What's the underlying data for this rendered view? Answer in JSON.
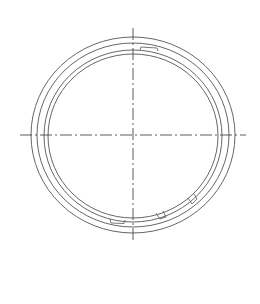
{
  "drawing": {
    "type": "technical-drawing",
    "subject": "retaining ring / seal ring front view",
    "center": {
      "x": 133,
      "y": 135
    },
    "colors": {
      "background": "#ffffff",
      "line": "#555555",
      "centerline": "#333333"
    },
    "rings": [
      {
        "name": "outer-ring-outer-edge",
        "rx": 102,
        "ry": 98
      },
      {
        "name": "outer-ring-inner-edge",
        "rx": 96,
        "ry": 91
      },
      {
        "name": "inner-ring-outer-edge",
        "rx": 89,
        "ry": 85
      },
      {
        "name": "inner-ring-inner-edge",
        "rx": 85,
        "ry": 81
      }
    ],
    "centerlines": {
      "horizontal": {
        "x1": 20,
        "x2": 246,
        "y": 135
      },
      "vertical": {
        "x": 133,
        "y1": 28,
        "y2": 242
      }
    },
    "features": [
      {
        "name": "top-notch",
        "position": "top, right of vertical centerline"
      },
      {
        "name": "bottom-notch",
        "position": "bottom, left of vertical centerline"
      },
      {
        "name": "bottom-tab-1",
        "position": "bottom-right"
      },
      {
        "name": "bottom-tab-2",
        "position": "lower-right"
      }
    ]
  }
}
